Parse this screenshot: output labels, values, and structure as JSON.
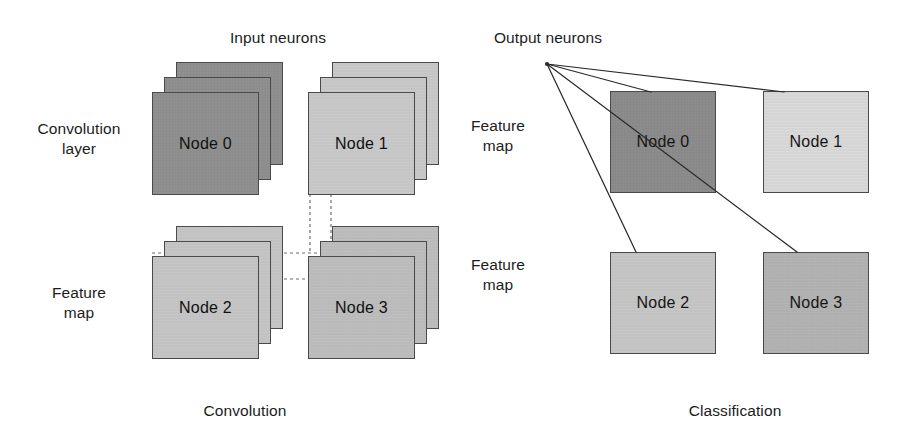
{
  "figure": {
    "width": 906,
    "height": 438,
    "background": "#ffffff"
  },
  "labels": {
    "input_neurons": "Input neurons",
    "output_neurons": "Output neurons",
    "convolution_layer": "Convolution\nlayer",
    "feature_map_left": "Feature\nmap",
    "feature_map_mid_top": "Feature\nmap",
    "feature_map_mid_bottom": "Feature\nmap"
  },
  "captions": {
    "left": "Convolution",
    "right": "Classification"
  },
  "convolution": {
    "section_caption": "Convolution",
    "nodes": [
      {
        "id": "conv-node-0",
        "label": "Node 0",
        "fill": "#8e8e8e",
        "x": 152,
        "y": 62
      },
      {
        "id": "conv-node-1",
        "label": "Node 1",
        "fill": "#c9c9c9",
        "x": 308,
        "y": 62
      },
      {
        "id": "conv-node-2",
        "label": "Node 2",
        "fill": "#c5c5c5",
        "x": 152,
        "y": 226
      },
      {
        "id": "conv-node-3",
        "label": "Node 3",
        "fill": "#bdbdbd",
        "x": 308,
        "y": 226
      }
    ],
    "sheets_per_node": 3
  },
  "classification": {
    "section_caption": "Classification",
    "fan_origin": {
      "x": 547,
      "y": 64
    },
    "nodes": [
      {
        "id": "cls-node-0",
        "label": "Node 0",
        "fill": "#8a8a8a",
        "x": 610,
        "y": 91
      },
      {
        "id": "cls-node-1",
        "label": "Node 1",
        "fill": "#d9d9d9",
        "x": 763,
        "y": 91
      },
      {
        "id": "cls-node-2",
        "label": "Node 2",
        "fill": "#c6c6c6",
        "x": 610,
        "y": 252
      },
      {
        "id": "cls-node-3",
        "label": "Node 3",
        "fill": "#b2b2b2",
        "x": 763,
        "y": 252
      }
    ],
    "connections": [
      {
        "from": "output-neuron",
        "to": "cls-node-0"
      },
      {
        "from": "output-neuron",
        "to": "cls-node-1"
      },
      {
        "from": "output-neuron",
        "to": "cls-node-2"
      },
      {
        "from": "output-neuron",
        "to": "cls-node-3"
      }
    ]
  },
  "guides": {
    "style": "dashed",
    "color": "#6e6e6e",
    "description": "receptive-field guide lines linking the convolution layer patch to the feature map"
  },
  "colors": {
    "stroke": "#4a4a4a",
    "text": "#1c1c1c",
    "line": "#2a2a2a",
    "dash": "#6e6e6e"
  }
}
